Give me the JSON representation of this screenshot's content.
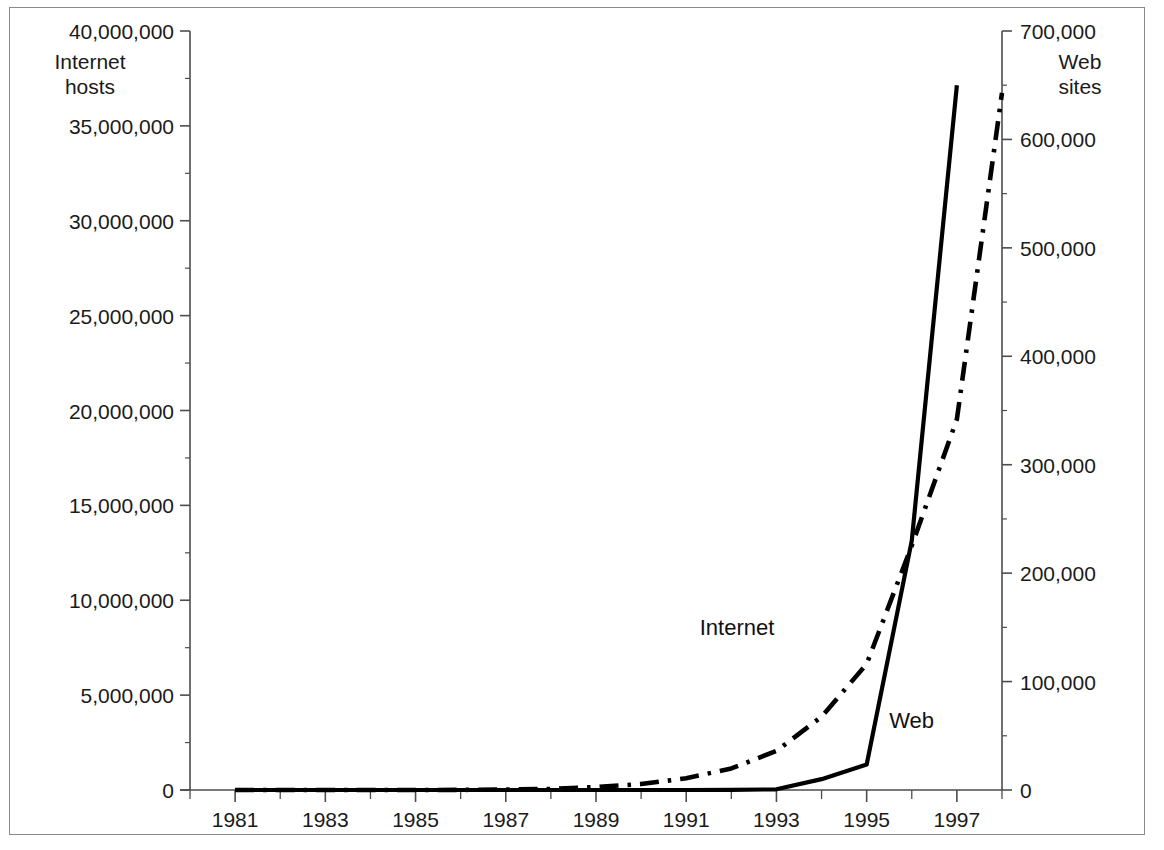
{
  "chart_data": {
    "type": "line",
    "title": "",
    "subtitle": "",
    "xlabel": "",
    "ylabel": "Internet\nhosts",
    "y2label": "Web\nsites",
    "grid": false,
    "legend_position": "inline-annotation",
    "xlim": [
      1980,
      1998
    ],
    "ylim": [
      0,
      40000000
    ],
    "y2lim": [
      0,
      700000
    ],
    "x_major_ticks": [
      1981,
      1983,
      1985,
      1987,
      1989,
      1991,
      1993,
      1995,
      1997
    ],
    "x_minor_ticks": [
      1980,
      1982,
      1984,
      1986,
      1988,
      1990,
      1992,
      1994,
      1996,
      1998
    ],
    "x_tick_labels": [
      "1981",
      "1983",
      "1985",
      "1987",
      "1989",
      "1991",
      "1993",
      "1995",
      "1997"
    ],
    "y_ticks": [
      0,
      5000000,
      10000000,
      15000000,
      20000000,
      25000000,
      30000000,
      35000000,
      40000000
    ],
    "y_tick_labels": [
      "0",
      "5,000,000",
      "10,000,000",
      "15,000,000",
      "20,000,000",
      "25,000,000",
      "30,000,000",
      "35,000,000",
      "40,000,000"
    ],
    "y_minor_step": 2500000,
    "y2_ticks": [
      0,
      100000,
      200000,
      300000,
      400000,
      500000,
      600000,
      700000
    ],
    "y2_tick_labels": [
      "0",
      "100,000",
      "200,000",
      "300,000",
      "400,000",
      "500,000",
      "600,000",
      "700,000"
    ],
    "y2_minor_step": 50000,
    "series": [
      {
        "name": "Internet",
        "axis": "left",
        "style": "dash-dot",
        "color": "#000000",
        "x": [
          1981,
          1982,
          1983,
          1984,
          1985,
          1986,
          1987,
          1988,
          1989,
          1990,
          1991,
          1992,
          1993,
          1994,
          1995,
          1996,
          1997,
          1998
        ],
        "values": [
          213,
          235,
          562,
          1024,
          1961,
          5089,
          28174,
          56000,
          159000,
          313000,
          617000,
          1136000,
          2056000,
          3864000,
          6642000,
          12881000,
          19540000,
          36739000
        ]
      },
      {
        "name": "Web",
        "axis": "right",
        "style": "solid",
        "color": "#000000",
        "x": [
          1981,
          1982,
          1983,
          1984,
          1985,
          1986,
          1987,
          1988,
          1989,
          1990,
          1991,
          1992,
          1993,
          1994,
          1995,
          1996,
          1997
        ],
        "values": [
          0,
          0,
          0,
          0,
          0,
          0,
          0,
          0,
          0,
          0,
          0,
          50,
          623,
          10022,
          23500,
          230000,
          650000
        ]
      }
    ],
    "annotations": [
      {
        "text": "Internet",
        "x": 1991.3,
        "y_frac": 0.215
      },
      {
        "text": "Web",
        "x": 1995.5,
        "y_frac": 0.092
      }
    ]
  },
  "axes": {
    "left_axis_title": "Internet\nhosts",
    "right_axis_title": "Web\nsites",
    "left_ticks": [
      {
        "label": "40,000,000",
        "value": 40000000
      },
      {
        "label": "35,000,000",
        "value": 35000000
      },
      {
        "label": "30,000,000",
        "value": 30000000
      },
      {
        "label": "25,000,000",
        "value": 25000000
      },
      {
        "label": "20,000,000",
        "value": 20000000
      },
      {
        "label": "15,000,000",
        "value": 15000000
      },
      {
        "label": "10,000,000",
        "value": 10000000
      },
      {
        "label": "5,000,000",
        "value": 5000000
      },
      {
        "label": "0",
        "value": 0
      }
    ],
    "right_ticks": [
      {
        "label": "700,000",
        "value": 700000
      },
      {
        "label": "600,000",
        "value": 600000
      },
      {
        "label": "500,000",
        "value": 500000
      },
      {
        "label": "400,000",
        "value": 400000
      },
      {
        "label": "300,000",
        "value": 300000
      },
      {
        "label": "200,000",
        "value": 200000
      },
      {
        "label": "100,000",
        "value": 100000
      },
      {
        "label": "0",
        "value": 0
      }
    ],
    "x_ticks": [
      {
        "label": "1981",
        "value": 1981
      },
      {
        "label": "1983",
        "value": 1983
      },
      {
        "label": "1985",
        "value": 1985
      },
      {
        "label": "1987",
        "value": 1987
      },
      {
        "label": "1989",
        "value": 1989
      },
      {
        "label": "1991",
        "value": 1991
      },
      {
        "label": "1993",
        "value": 1993
      },
      {
        "label": "1995",
        "value": 1995
      },
      {
        "label": "1997",
        "value": 1997
      }
    ]
  },
  "series_labels": {
    "internet": "Internet",
    "web": "Web"
  },
  "colors": {
    "line": "#000000",
    "axis": "#4d4d4d",
    "frame": "#8a8a8a",
    "text": "#1a1a1a",
    "background": "#ffffff"
  }
}
